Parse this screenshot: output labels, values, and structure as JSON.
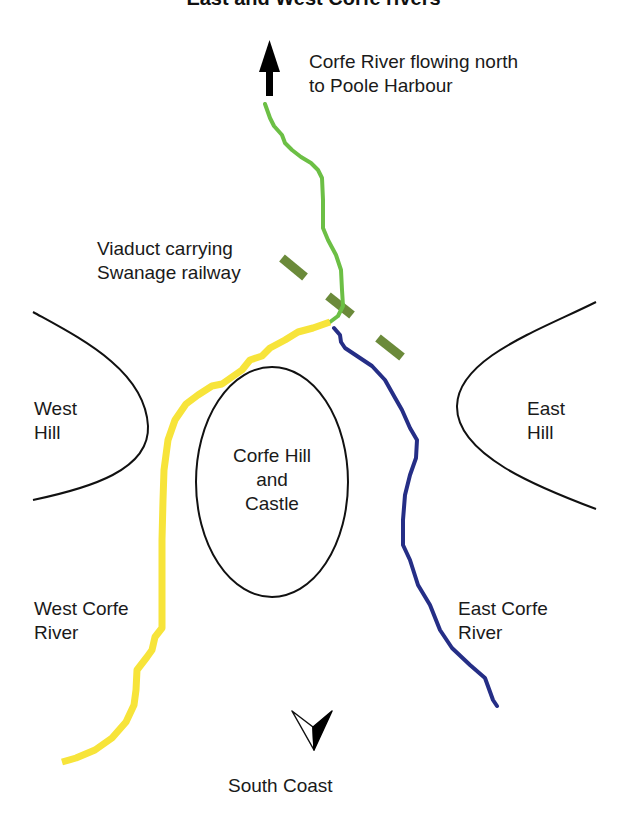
{
  "title": "East and West Corfe rivers",
  "colors": {
    "west_river": "#f7e43a",
    "east_river": "#252e86",
    "corfe_river": "#6cbf45",
    "viaduct": "#6b8a3a",
    "outline": "#111111",
    "background": "#ffffff"
  },
  "labels": {
    "north_flow": {
      "line1": "Corfe River flowing north",
      "line2": "to Poole Harbour"
    },
    "viaduct": {
      "line1": "Viaduct carrying",
      "line2": "Swanage railway"
    },
    "west_hill": {
      "line1": "West",
      "line2": "Hill"
    },
    "east_hill": {
      "line1": "East",
      "line2": "Hill"
    },
    "castle": {
      "line1": "Corfe Hill",
      "line2": "and",
      "line3": "Castle"
    },
    "west_river": {
      "line1": "West Corfe",
      "line2": "River"
    },
    "east_river": {
      "line1": "East Corfe",
      "line2": "River"
    },
    "south": "South Coast"
  },
  "icons": {
    "north_arrow": "arrow-up-icon",
    "compass": "compass-south-pointer-icon"
  }
}
